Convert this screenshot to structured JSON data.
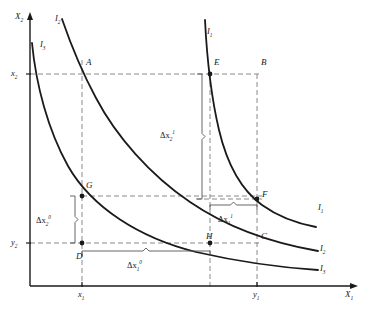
{
  "figure": {
    "background": "#ffffff",
    "ink": "#1a1a1a",
    "dash_color": "#8a8a8a"
  },
  "axes": {
    "y_label": "X",
    "y_label_sub": "2",
    "x_label": "X",
    "x_label_sub": "1",
    "origin": {
      "x": 30,
      "y": 286
    },
    "x_axis_end": {
      "x": 352,
      "y": 286
    },
    "y_axis_end": {
      "x": 30,
      "y": 18
    }
  },
  "ticks": [
    {
      "name": "x1",
      "base": "x",
      "sub": "1",
      "axis": "x",
      "px": 82
    },
    {
      "name": "y1",
      "base": "y",
      "sub": "1",
      "axis": "x",
      "px": 257
    },
    {
      "name": "x2",
      "base": "x",
      "sub": "2",
      "axis": "y",
      "px": 74
    },
    {
      "name": "y2",
      "base": "y",
      "sub": "2",
      "axis": "y",
      "px": 243
    }
  ],
  "points": [
    {
      "label": "A",
      "x": 82,
      "y": 74,
      "lx": 86,
      "ly": 58,
      "dot": false
    },
    {
      "label": "B",
      "x": 257,
      "y": 74,
      "lx": 261,
      "ly": 58,
      "dot": false
    },
    {
      "label": "E",
      "x": 210,
      "y": 74,
      "lx": 214,
      "ly": 58,
      "dot": true
    },
    {
      "label": "F",
      "x": 257,
      "y": 199,
      "lx": 262,
      "ly": 190,
      "dot": true
    },
    {
      "label": "G",
      "x": 82,
      "y": 196,
      "lx": 86,
      "ly": 181,
      "dot": true
    },
    {
      "label": "H",
      "x": 210,
      "y": 243,
      "lx": 206,
      "ly": 232,
      "dot": true
    },
    {
      "label": "C",
      "x": 257,
      "y": 243,
      "lx": 261,
      "ly": 232,
      "dot": false
    },
    {
      "label": "D",
      "x": 82,
      "y": 243,
      "lx": 76,
      "ly": 252,
      "dot": true
    }
  ],
  "curves": [
    {
      "id": "I1",
      "label": "I",
      "label_sub": "1",
      "label_positions": [
        {
          "lx": 207,
          "ly": 27
        },
        {
          "lx": 318,
          "ly": 203
        }
      ],
      "path": "M 205 20 C 207 60, 211 96, 219 130 C 228 168, 244 192, 262 205 C 280 218, 300 224, 316 227"
    },
    {
      "id": "I2",
      "label": "I",
      "label_sub": "2",
      "label_positions": [
        {
          "lx": 55,
          "ly": 14
        },
        {
          "lx": 320,
          "ly": 244
        }
      ],
      "path": "M 62 19 C 72 48, 82 72, 96 98 C 116 136, 150 175, 190 202 C 228 228, 272 243, 318 251"
    },
    {
      "id": "I3",
      "label": "I",
      "label_sub": "3",
      "label_positions": [
        {
          "lx": 40,
          "ly": 40
        },
        {
          "lx": 320,
          "ly": 264
        }
      ],
      "path": "M 32 43 C 36 85, 48 130, 68 166 C 92 208, 140 238, 196 252 C 244 263, 288 268, 318 270"
    }
  ],
  "annotations": [
    {
      "id": "dx2_1",
      "base": "Δx",
      "sub": "2",
      "sup": "1",
      "orientation": "vertical",
      "from": {
        "x": 197,
        "y": 74
      },
      "to": {
        "x": 197,
        "y": 199
      },
      "lx": 160,
      "ly": 130
    },
    {
      "id": "dx2_0",
      "base": "Δx",
      "sub": "2",
      "sup": "0",
      "orientation": "vertical",
      "from": {
        "x": 70,
        "y": 196
      },
      "to": {
        "x": 70,
        "y": 243
      },
      "lx": 36,
      "ly": 215
    },
    {
      "id": "dx1_1",
      "base": "Δx",
      "sub": "1",
      "sup": "1",
      "orientation": "horizontal",
      "from": {
        "x": 210,
        "y": 210
      },
      "to": {
        "x": 257,
        "y": 210
      },
      "lx": 218,
      "ly": 214
    },
    {
      "id": "dx1_0",
      "base": "Δx",
      "sub": "1",
      "sup": "0",
      "orientation": "horizontal",
      "from": {
        "x": 82,
        "y": 256
      },
      "to": {
        "x": 210,
        "y": 256
      },
      "lx": 127,
      "ly": 260
    }
  ],
  "guides": [
    {
      "id": "h-x2",
      "type": "h",
      "y": 74,
      "x1": 30,
      "x2": 262
    },
    {
      "id": "h-y2",
      "type": "h",
      "y": 243,
      "x1": 30,
      "x2": 262
    },
    {
      "id": "h-G-F",
      "type": "h",
      "y": 196,
      "x1": 82,
      "x2": 262
    },
    {
      "id": "h-F",
      "type": "h",
      "y": 199,
      "x1": 196,
      "x2": 262
    },
    {
      "id": "v-x1",
      "type": "v",
      "x": 82,
      "y1": 60,
      "y2": 286
    },
    {
      "id": "v-E",
      "type": "v",
      "x": 210,
      "y1": 74,
      "y2": 286
    },
    {
      "id": "v-y1",
      "type": "v",
      "x": 257,
      "y1": 74,
      "y2": 286
    }
  ]
}
